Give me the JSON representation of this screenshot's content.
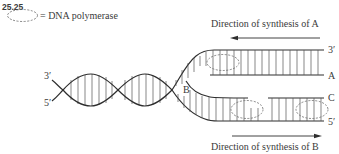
{
  "figure": {
    "number": "25.25"
  },
  "legend": {
    "symbol": "dashed-ellipse",
    "text": "= DNA polymerase"
  },
  "labels": {
    "direction_a": "Direction of synthesis of A",
    "direction_b": "Direction of synthesis of B",
    "helix_3prime": "3′",
    "helix_5prime": "5′",
    "fork": "B",
    "top_3prime": "3′",
    "strand_a": "A",
    "strand_c": "C",
    "bottom_5prime": "5′"
  },
  "colors": {
    "line": "#2e2e2e",
    "rung": "#555555",
    "dashed": "#6a6a6a",
    "text": "#3a3a3a"
  }
}
